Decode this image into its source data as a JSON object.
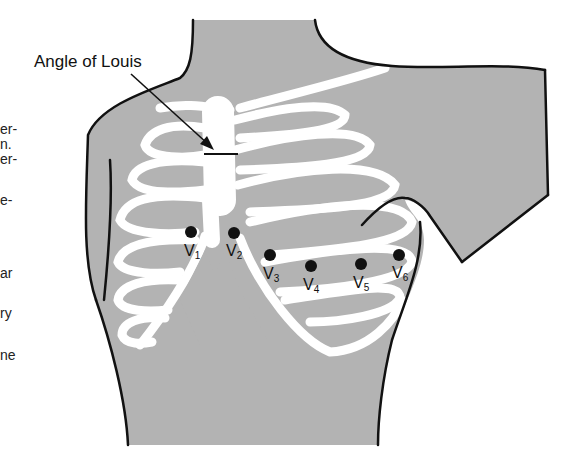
{
  "figure": {
    "annotation": "Angle of Louis",
    "colors": {
      "skin": "#b3b3b3",
      "bone": "#ffffff",
      "outline": "#111111",
      "electrode": "#111111"
    }
  },
  "left_text_fragments": [
    "er-",
    "n.",
    "er-",
    "e-",
    "ar",
    "ry",
    "ne"
  ],
  "electrodes": [
    {
      "letter": "V",
      "sub": "1"
    },
    {
      "letter": "V",
      "sub": "2"
    },
    {
      "letter": "V",
      "sub": "3"
    },
    {
      "letter": "V",
      "sub": "4"
    },
    {
      "letter": "V",
      "sub": "5"
    },
    {
      "letter": "V",
      "sub": "6"
    }
  ]
}
